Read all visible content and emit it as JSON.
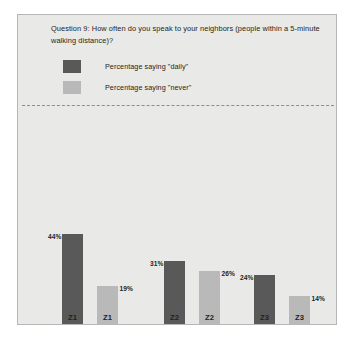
{
  "slide": {
    "title": "Question 9: How often do you speak to your neighbors (people within a 5-minute walking distance)?",
    "panel_background": "#e9e9e7",
    "border_color": "#b6b6b4"
  },
  "legend": {
    "items": [
      {
        "label": "Percentage saying \"daily\"",
        "color": "#595959",
        "series": "daily"
      },
      {
        "label": "Percentage saying \"never\"",
        "color": "#b9b9b9",
        "series": "never"
      }
    ]
  },
  "chart_data": {
    "type": "bar",
    "title": "Question 9: How often do you speak to your neighbors (people within a 5-minute walking distance)?",
    "xlabel": "",
    "ylabel": "",
    "ylim": [
      0,
      50
    ],
    "grid": false,
    "legend_position": "top-left",
    "categories": [
      "Z1",
      "Z2",
      "Z3"
    ],
    "series": [
      {
        "name": "Percentage saying \"daily\"",
        "color": "#595959",
        "values": [
          44,
          31,
          24
        ]
      },
      {
        "name": "Percentage saying \"never\"",
        "color": "#b9b9b9",
        "values": [
          19,
          26,
          14
        ]
      }
    ],
    "bars": [
      {
        "category": "Z1",
        "series": "daily",
        "value": 44,
        "label": "44%",
        "label_side": "left",
        "tick_label": "Z1",
        "x": 61
      },
      {
        "category": "Z1",
        "series": "never",
        "value": 19,
        "label": "19%",
        "label_side": "right",
        "tick_label": "Z1",
        "x": 96
      },
      {
        "category": "Z2",
        "series": "daily",
        "value": 31,
        "label": "31%",
        "label_side": "left",
        "tick_label": "Z2",
        "x": 163
      },
      {
        "category": "Z2",
        "series": "never",
        "value": 26,
        "label": "26%",
        "label_side": "right",
        "tick_label": "Z2",
        "x": 198
      },
      {
        "category": "Z3",
        "series": "daily",
        "value": 24,
        "label": "24%",
        "label_side": "left",
        "tick_label": "Z3",
        "x": 253
      },
      {
        "category": "Z3",
        "series": "never",
        "value": 14,
        "label": "14%",
        "label_side": "right",
        "tick_label": "Z3",
        "x": 288
      }
    ]
  }
}
